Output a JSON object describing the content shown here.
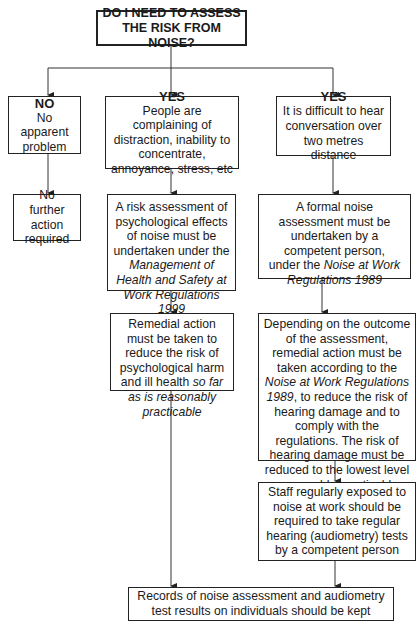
{
  "diagram": {
    "title": [
      "DO I NEED TO ASSESS",
      "THE RISK FROM NOISE?"
    ],
    "branches": {
      "no": {
        "heading": "NO",
        "condition": "No apparent problem",
        "outcome": "No further action required"
      },
      "yes_psychological": {
        "heading": "YES",
        "condition": "People are complaining of distraction, inability to concentrate, annoyance, stress, etc",
        "step1_pre": "A risk assessment of psychological effects of noise must be undertaken under the ",
        "step1_italic": "Management of Health and Safety at Work Regulations 1999",
        "step2_pre": "Remedial action must be taken to reduce the risk of psychological harm and ill health ",
        "step2_italic": "so far as is reasonably practicable"
      },
      "yes_hearing": {
        "heading": "YES",
        "condition": "It is difficult to hear conversation over two metres distance",
        "step1_pre": "A formal noise assessment must be undertaken by a competent person, under the ",
        "step1_italic": "Noise at Work Regulations 1989",
        "step2_pre": "Depending on the outcome of the assessment, remedial action must be taken according to the ",
        "step2_italic": "Noise at Work Regulations 1989",
        "step2_post": ", to reduce the risk of hearing damage and to comply with the regulations. The risk of hearing damage must be reduced to the lowest level reasonably practicable",
        "step3": "Staff regularly exposed to noise at work should be required to take regular hearing (audiometry) tests by a competent person"
      }
    },
    "final": "Records of noise assessment and audiometry test results on individuals should be kept"
  }
}
